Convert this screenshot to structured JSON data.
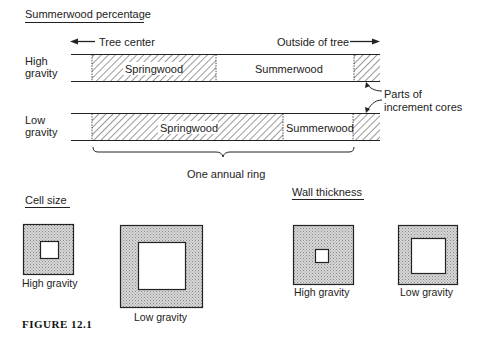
{
  "figure": {
    "caption": "FIGURE 12.1"
  },
  "summerwood_section": {
    "title": "Summerwood percentage",
    "direction_left": "Tree center",
    "direction_right": "Outside of tree",
    "rows": [
      {
        "label_line1": "High",
        "label_line2": "gravity",
        "springwood_label": "Springwood",
        "summerwood_label": "Summerwood"
      },
      {
        "label_line1": "Low",
        "label_line2": "gravity",
        "springwood_label": "Springwood",
        "summerwood_label": "Summerwood"
      }
    ],
    "annotation_line1": "Parts of",
    "annotation_line2": "increment cores",
    "brace_label": "One annual ring"
  },
  "cell_size_section": {
    "title": "Cell size",
    "items": [
      {
        "label": "High gravity"
      },
      {
        "label": "Low gravity"
      }
    ]
  },
  "wall_thickness_section": {
    "title": "Wall thickness",
    "items": [
      {
        "label": "High gravity"
      },
      {
        "label": "Low gravity"
      }
    ]
  },
  "colors": {
    "stroke": "#222222",
    "stipple_fill": "#c8c8c8",
    "background": "#ffffff"
  }
}
